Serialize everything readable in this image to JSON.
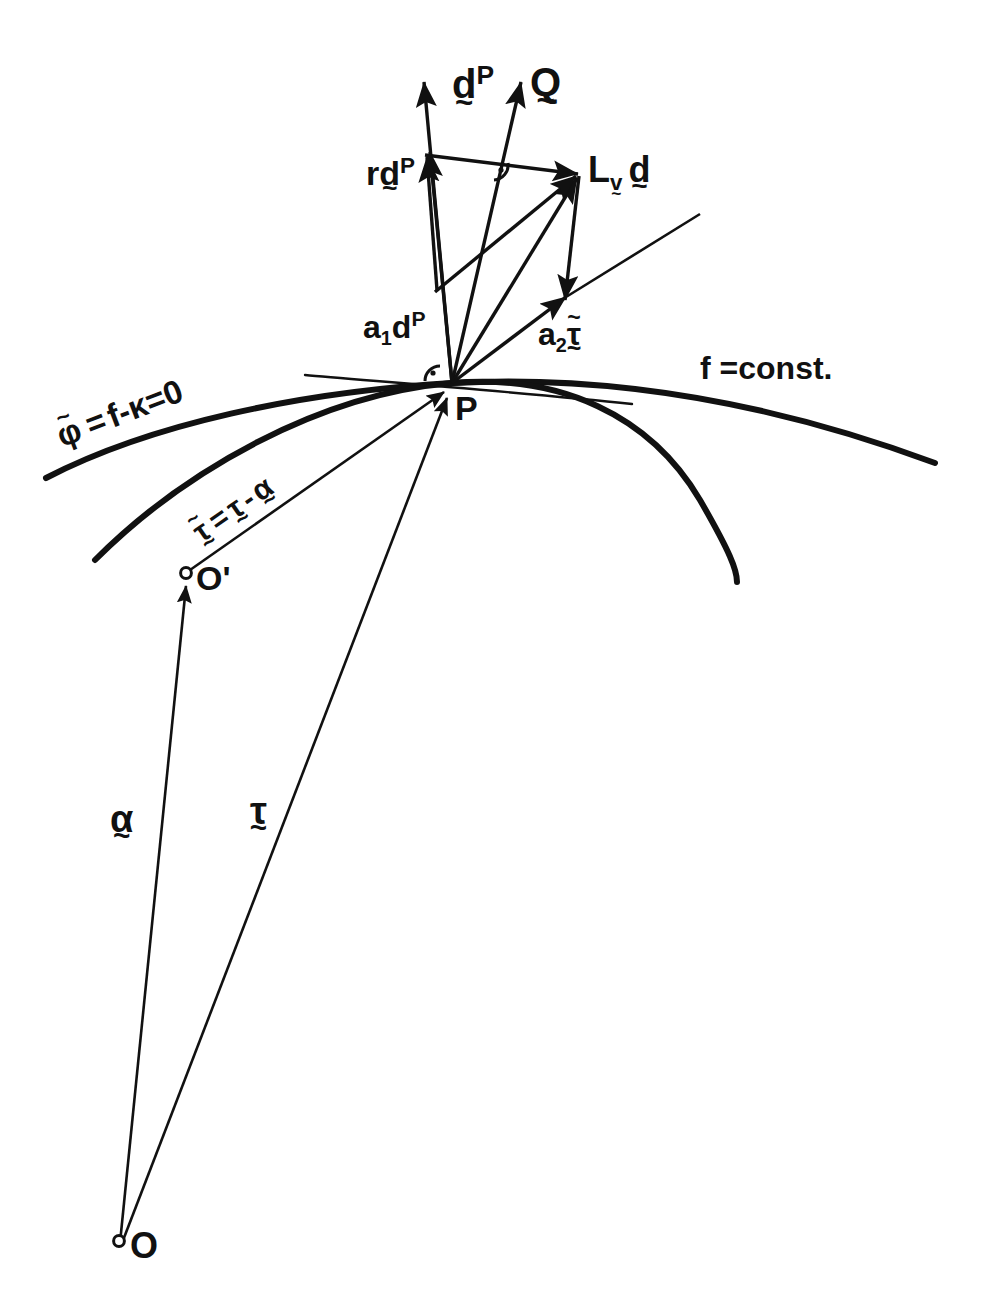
{
  "figure": {
    "background_color": "#ffffff",
    "ink_color": "#111111",
    "width": 984,
    "height": 1297
  },
  "points": [
    {
      "id": "P",
      "label": "P",
      "x": 452,
      "y": 383,
      "marker": "junction"
    },
    {
      "id": "Oprime",
      "label": "O'",
      "x": 185,
      "y": 575,
      "marker": "open-circle"
    },
    {
      "id": "O",
      "label": "O",
      "x": 120,
      "y": 1243,
      "marker": "open-circle"
    }
  ],
  "curves": {
    "f_const": {
      "label": "f =const.",
      "label_x": 700,
      "label_y": 360,
      "stroke_width": 6
    },
    "phi_tilde": {
      "label_parts": {
        "phi": "φ",
        "eq1": "=",
        "f": "f",
        "minus": "-",
        "kappa": "κ",
        "eq2": "=",
        "zero": "0"
      },
      "label_text": "φ̃ = f - κ = 0",
      "label_x": 60,
      "label_y": 405,
      "label_rotation": -21,
      "stroke_width": 6
    }
  },
  "vectors": {
    "d_P_long": {
      "label_base": "d",
      "label_sup": "P",
      "under_tilde": "~",
      "label_x": 455,
      "label_y": 68
    },
    "Q": {
      "label_base": "Q",
      "under_tilde": "~",
      "label_x": 532,
      "label_y": 68
    },
    "r_d_P": {
      "prefix": "r",
      "label_base": "d",
      "label_sup": "P",
      "under_tilde": "~",
      "label_x": 373,
      "label_y": 160
    },
    "L_v_d": {
      "label_base": "L",
      "sub_base": "v",
      "sub_tilde": "~",
      "second_base": "d",
      "second_tilde": "~",
      "label_x": 590,
      "label_y": 158
    },
    "a1_dP": {
      "coeff": "a",
      "coeff_sub": "1",
      "label_base": "d",
      "label_sup": "P",
      "label_x": 369,
      "label_y": 313
    },
    "a2_tau": {
      "coeff": "a",
      "coeff_sub": "2",
      "label_base": "τ",
      "over_tilde": "~",
      "under_tilde": "~",
      "label_x": 543,
      "label_y": 320
    },
    "tau_tilde_rel": {
      "text": "τ̃ = τ - α",
      "label_x": 200,
      "label_y": 500,
      "label_rotation": -38
    },
    "alpha": {
      "label_base": "α",
      "under_tilde": "~",
      "label_x": 114,
      "label_y": 805
    },
    "tau": {
      "label_base": "τ",
      "under_tilde": "~",
      "label_x": 253,
      "label_y": 797
    }
  },
  "angle_markers": [
    {
      "id": "right-angle-at-P",
      "x": 438,
      "y": 371,
      "note": "right angle dot marker"
    },
    {
      "id": "right-angle-upper",
      "x": 501,
      "y": 166,
      "note": "right angle dot marker"
    }
  ],
  "symbols": {
    "tilde": "~",
    "equals": "=",
    "minus": "-",
    "prime": "'"
  }
}
